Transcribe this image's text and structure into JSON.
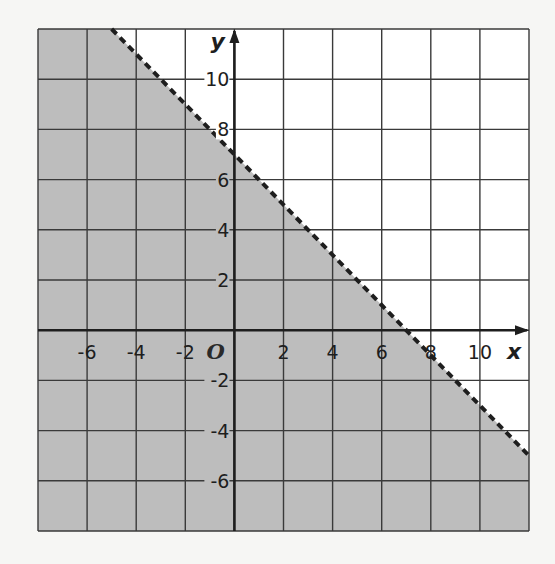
{
  "chart_data": {
    "type": "inequality-graph",
    "title": "",
    "xlabel": "x",
    "ylabel": "y",
    "origin_label": "O",
    "xlim": [
      -8,
      12
    ],
    "ylim": [
      -8,
      12
    ],
    "grid": true,
    "grid_step": 2,
    "x_tick_labels": [
      "-6",
      "-4",
      "-2",
      "2",
      "4",
      "6",
      "8",
      "10"
    ],
    "x_tick_values": [
      -6,
      -4,
      -2,
      2,
      4,
      6,
      8,
      10
    ],
    "y_tick_labels": [
      "-6",
      "-4",
      "-2",
      "2",
      "4",
      "6",
      "8",
      "10"
    ],
    "y_tick_values": [
      -6,
      -4,
      -2,
      2,
      4,
      6,
      8,
      10
    ],
    "boundary_line": {
      "equation": "y = -x + 7",
      "slope": -1,
      "y_intercept": 7,
      "x_intercept": 7,
      "style": "dashed",
      "points": [
        [
          -5,
          12
        ],
        [
          12,
          -5
        ]
      ]
    },
    "shaded_region": "below",
    "inequality": "x + y < 7",
    "colors": {
      "shade": "#bdbdbd",
      "background": "#f6f6f4",
      "grid": "#3a3a3a",
      "line": "#1e1e1e"
    }
  }
}
